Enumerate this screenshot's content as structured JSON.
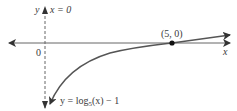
{
  "figure": {
    "asymptote_label": "x = 0",
    "y_axis_label": "y",
    "x_axis_label": "x",
    "origin_label": "0",
    "point_label": "(5, 0)",
    "curve_label_prefix": "y = log",
    "curve_label_base": "5",
    "curve_label_suffix": "(x) − 1",
    "colors": {
      "axis": "#555555",
      "curve": "#555555",
      "point": "#111111",
      "asymptote": "#666666"
    }
  },
  "function": {
    "expression": "y = log5(x) - 1",
    "vertical_asymptote": "x = 0",
    "x_intercept": [
      5,
      0
    ]
  }
}
